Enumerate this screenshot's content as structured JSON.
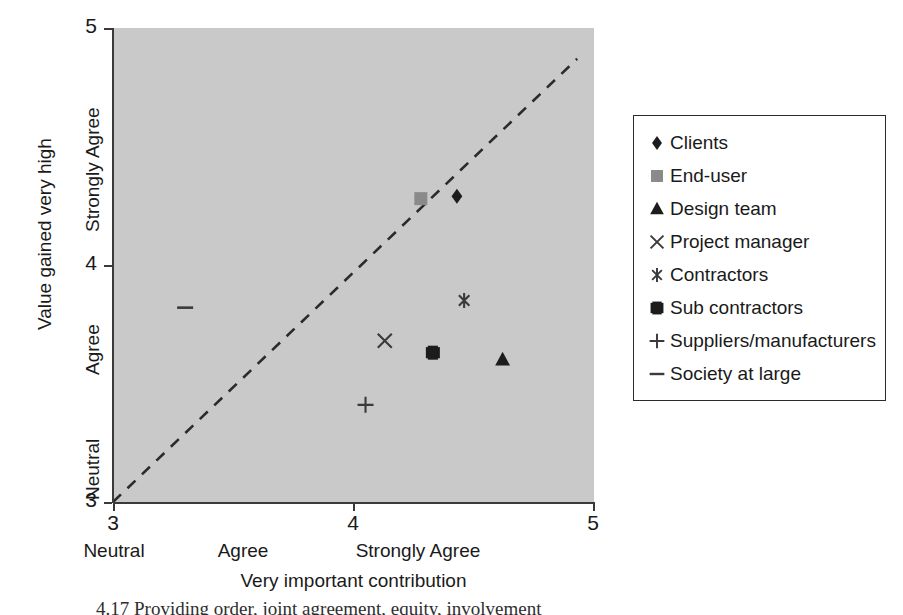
{
  "chart_data": {
    "type": "scatter",
    "title": "",
    "xlabel": "Very important contribution",
    "ylabel": "Value gained very high",
    "xlim": [
      3,
      5
    ],
    "ylim": [
      3,
      5
    ],
    "grid": false,
    "background": "#c9c9c9",
    "legend_position": "right-outside",
    "x_tick_values": [
      "3",
      "4",
      "5"
    ],
    "y_tick_values": [
      "3",
      "4",
      "5"
    ],
    "x_category_labels": [
      "Neutral",
      "Agree",
      "Strongly Agree"
    ],
    "y_category_labels": [
      "Neutral",
      "Agree",
      "Strongly Agree"
    ],
    "reference_line": {
      "label": "diagonal",
      "style": "dashed",
      "color": "#2b2b2b",
      "from": [
        3.0,
        3.0
      ],
      "to": [
        4.93,
        4.87
      ]
    },
    "series": [
      {
        "name": "Clients",
        "marker": "diamond",
        "color": "#1c1c1c",
        "x": 4.43,
        "y": 4.29
      },
      {
        "name": "End-user",
        "marker": "square-gray",
        "color": "#8a8a8a",
        "x": 4.28,
        "y": 4.28
      },
      {
        "name": "Design team",
        "marker": "triangle",
        "color": "#1c1c1c",
        "x": 4.62,
        "y": 3.6
      },
      {
        "name": "Project manager",
        "marker": "x",
        "color": "#3a3a3a",
        "x": 4.13,
        "y": 3.68
      },
      {
        "name": "Contractors",
        "marker": "asterisk",
        "color": "#3a3a3a",
        "x": 4.46,
        "y": 3.85
      },
      {
        "name": "Sub contractors",
        "marker": "square-notched",
        "color": "#1c1c1c",
        "x": 4.33,
        "y": 3.63
      },
      {
        "name": "Suppliers/manufacturers",
        "marker": "plus",
        "color": "#3a3a3a",
        "x": 4.05,
        "y": 3.41
      },
      {
        "name": "Society at large",
        "marker": "dash",
        "color": "#3a3a3a",
        "x": 3.3,
        "y": 3.82
      }
    ]
  },
  "axes": {
    "y_title": "Value gained very high",
    "x_title": "Very important contribution",
    "y_ticks": [
      {
        "value": "5",
        "label": ""
      },
      {
        "value": "4",
        "label": ""
      },
      {
        "value": "3",
        "label": ""
      }
    ],
    "y_categories": [
      {
        "label": "Strongly Agree"
      },
      {
        "label": "Agree"
      },
      {
        "label": "Neutral"
      }
    ],
    "x_ticks": [
      {
        "value": "3"
      },
      {
        "value": "4"
      },
      {
        "value": "5"
      }
    ],
    "x_categories": [
      {
        "label": "Neutral"
      },
      {
        "label": "Agree"
      },
      {
        "label": "Strongly Agree"
      }
    ]
  },
  "legend": {
    "items": [
      {
        "label": "Clients",
        "marker": "diamond-icon"
      },
      {
        "label": "End-user",
        "marker": "square-gray-icon"
      },
      {
        "label": "Design team",
        "marker": "triangle-icon"
      },
      {
        "label": "Project manager",
        "marker": "x-icon"
      },
      {
        "label": "Contractors",
        "marker": "asterisk-icon"
      },
      {
        "label": "Sub contractors",
        "marker": "square-notched-icon"
      },
      {
        "label": "Suppliers/manufacturers",
        "marker": "plus-icon"
      },
      {
        "label": "Society at large",
        "marker": "dash-icon"
      }
    ]
  },
  "caption": {
    "sliver_text": "4.17   Providing order, joint agreement, equity, involvement"
  }
}
